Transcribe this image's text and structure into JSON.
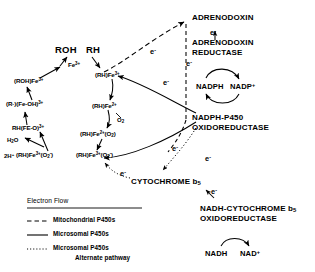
{
  "diagram": {
    "substrates": {
      "product_label": "ROH",
      "substrate_label": "RH"
    },
    "cycle_species": [
      {
        "id": "fe3",
        "label": "Fe3+",
        "html": "Fe<sup>3+</sup>"
      },
      {
        "id": "rh_fe3",
        "label": "(RH)Fe3+",
        "html": "(RH)Fe<sup>3+</sup>"
      },
      {
        "id": "rh_fe2",
        "label": "(RH)Fe2+",
        "html": "(RH)Fe<sup>2+</sup>"
      },
      {
        "id": "rh_fe2_o2",
        "label": "(RH)Fe2+(O2)",
        "html": "(RH)Fe<sup>2+</sup>(O<sub>2</sub>)"
      },
      {
        "id": "rh_fe3_o2m",
        "label": "(RH)Fe3+(O2-)",
        "html": "(RH)Fe<sup>3+</sup>(O<sub>2</sub><sup>-</sup>)"
      },
      {
        "id": "rh_fe_o",
        "label": "RH(FE-O)3+",
        "html": "RH(FE-O)<sup>3+</sup>"
      },
      {
        "id": "r_fe_oh",
        "label": "(R-)(Fe-OH)3+",
        "html": "(R&middot;)(Fe-OH)<sup>3+</sup>"
      },
      {
        "id": "roh_fe3",
        "label": "(ROH)Fe3+",
        "html": "(ROH)Fe<sup>3+</sup>"
      }
    ],
    "reactants": {
      "oxygen": "O2",
      "oxygen_html": "O<sub>2</sub>",
      "water": "H2O",
      "water_html": "H<sub>2</sub>O",
      "protons": "2H+",
      "protons_html": "2H<sup>+</sup>"
    },
    "electron_labels": [
      {
        "id": "e-adx-in",
        "label": "e-"
      },
      {
        "id": "e-adx-red",
        "label": "e-"
      },
      {
        "id": "e-mito-1",
        "label": "e-"
      },
      {
        "id": "e-nadph-1",
        "label": "e-"
      },
      {
        "id": "e-nadph-2",
        "label": "e-"
      },
      {
        "id": "e-b5-in",
        "label": "e-"
      },
      {
        "id": "e-b5-out",
        "label": "e-"
      },
      {
        "id": "e-b5-nadh",
        "label": "e-"
      }
    ],
    "electron_glyph": "e",
    "electron_charge": "-",
    "proteins": [
      {
        "id": "adrenodoxin",
        "lines": [
          "ADRENODOXIN"
        ]
      },
      {
        "id": "adrenodoxin-reductase",
        "lines": [
          "ADRENODOXIN",
          "REDUCTASE"
        ]
      },
      {
        "id": "nadph-p450-oxidoreductase",
        "lines": [
          "NADPH-P450",
          "OXIDOREDUCTASE"
        ]
      },
      {
        "id": "cytochrome-b5",
        "lines": [
          "CYTOCHROME b5"
        ],
        "html": "CYTOCHROME b<sub>5</sub>"
      },
      {
        "id": "nadh-cytochrome-b5-oxidoreductase",
        "lines": [
          "NADH-CYTOCHROME b5",
          "OXIDOREDUCTASE"
        ],
        "html_line1": "NADH-CYTOCHROME b<sub>5</sub>"
      }
    ],
    "cofactor_pairs": [
      {
        "id": "nadph-pair",
        "left": "NADPH",
        "right": "NADP+",
        "right_html": "NADP<sup>+</sup>"
      },
      {
        "id": "nadh-pair",
        "left": "NADH",
        "right": "NAD+",
        "right_html": "NAD<sup>+</sup>"
      }
    ],
    "legend": {
      "title": "Electron Flow",
      "entries": [
        {
          "style": "dashed",
          "label": "Mitochondrial P450s",
          "sub": ""
        },
        {
          "style": "solid",
          "label": "Microsomal P450s",
          "sub": ""
        },
        {
          "style": "dotted",
          "label": "Microsomal P450s",
          "sub": "Alternate pathway"
        }
      ]
    },
    "colors": {
      "ink": "#000000",
      "background": "#ffffff"
    }
  }
}
